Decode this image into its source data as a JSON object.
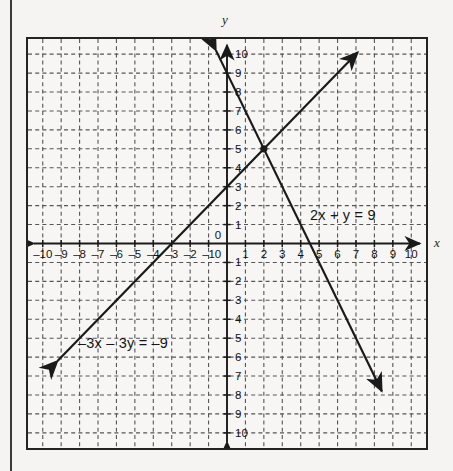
{
  "figure": {
    "kind": "coordinate-grid-graph",
    "background_color": "#f5f4f2",
    "frame_color": "#232323",
    "grid_color": "#55555a",
    "line_color": "#1a1a1a"
  },
  "axes": {
    "x_axis_name": "x",
    "y_axis_name": "y",
    "x_tick_labels": [
      "-10",
      "-9",
      "-8",
      "-7",
      "-6",
      "-5",
      "-4",
      "-3",
      "-2",
      "-1",
      "0",
      "1",
      "2",
      "3",
      "4",
      "5",
      "6",
      "7",
      "8",
      "9",
      "10"
    ],
    "y_tick_labels_positive": [
      "0",
      "1",
      "2",
      "3",
      "4",
      "5",
      "6",
      "7",
      "8",
      "9",
      "10"
    ],
    "y_tick_labels_negative": [
      "1",
      "2",
      "3",
      "4",
      "5",
      "6",
      "7",
      "8",
      "9",
      "10"
    ]
  },
  "labels": {
    "equation_1": "2x + y = 9",
    "equation_2": "–3x – 3y = –9"
  },
  "chart_data": {
    "type": "line",
    "title": "",
    "xlabel": "x",
    "ylabel": "y",
    "xlim": [
      -10.8,
      10.8
    ],
    "ylim": [
      -10.8,
      10.8
    ],
    "grid": true,
    "grid_step": 1,
    "grid_style": "dashed",
    "legend": "inline-annotations",
    "xticks": [
      -10,
      -9,
      -8,
      -7,
      -6,
      -5,
      -4,
      -3,
      -2,
      -1,
      0,
      1,
      2,
      3,
      4,
      5,
      6,
      7,
      8,
      9,
      10
    ],
    "yticks": [
      -10,
      -9,
      -8,
      -7,
      -6,
      -5,
      -4,
      -3,
      -2,
      -1,
      0,
      1,
      2,
      3,
      4,
      5,
      6,
      7,
      8,
      9,
      10
    ],
    "series": [
      {
        "name": "2x + y = 9",
        "label": "2x + y = 9",
        "slope": -2,
        "intercept": 9,
        "x_intercept": 4.5,
        "y_intercept": 9,
        "arrow_start": [
          -0.6,
          10.2
        ],
        "arrow_end": [
          8.4,
          -7.8
        ],
        "arrows": "both",
        "label_position": [
          5.1,
          1.6
        ]
      },
      {
        "name": "-3x - 3y = -9",
        "label": "–3x – 3y = –9",
        "slope": 1,
        "intercept": 3,
        "x_intercept": -3,
        "y_intercept": 3,
        "arrow_start": [
          -9.2,
          -6.2
        ],
        "arrow_end": [
          7.1,
          10.1
        ],
        "arrows": "both",
        "label_position": [
          -8.4,
          -5.3
        ]
      }
    ],
    "points": [
      {
        "label": "intersection",
        "x": 2,
        "y": 5,
        "marker": "filled-circle"
      }
    ]
  }
}
